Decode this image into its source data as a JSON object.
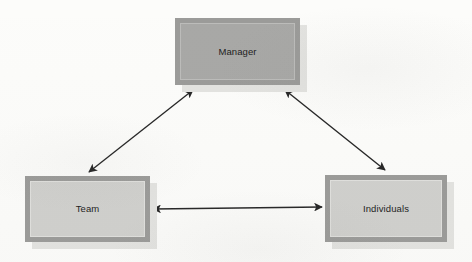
{
  "diagram": {
    "background_color": "#fcfcfa",
    "nodes": [
      {
        "id": "manager",
        "label": "Manager",
        "x": 175,
        "y": 18,
        "width": 125,
        "height": 67,
        "fill": "#a8a8a6",
        "border_color": "#9b9b99",
        "shade": "dark"
      },
      {
        "id": "team",
        "label": "Team",
        "x": 25,
        "y": 176,
        "width": 125,
        "height": 66,
        "fill": "#d0d0cd",
        "border_color": "#9b9b99",
        "shade": "light"
      },
      {
        "id": "individuals",
        "label": "Individuals",
        "x": 325,
        "y": 175,
        "width": 122,
        "height": 67,
        "fill": "#d0d0cd",
        "border_color": "#9b9b99",
        "shade": "light"
      }
    ],
    "connectors": [
      {
        "id": "manager-team",
        "from": "manager",
        "to": "team",
        "direction": "bidirectional",
        "x1": 193,
        "y1": 90,
        "x2": 89,
        "y2": 172,
        "color": "#262626"
      },
      {
        "id": "manager-individuals",
        "from": "manager",
        "to": "individuals",
        "direction": "bidirectional",
        "x1": 285,
        "y1": 90,
        "x2": 385,
        "y2": 170,
        "color": "#262626"
      },
      {
        "id": "team-individuals",
        "from": "team",
        "to": "individuals",
        "direction": "bidirectional",
        "x1": 153,
        "y1": 209,
        "x2": 322,
        "y2": 207,
        "color": "#262626"
      }
    ]
  }
}
